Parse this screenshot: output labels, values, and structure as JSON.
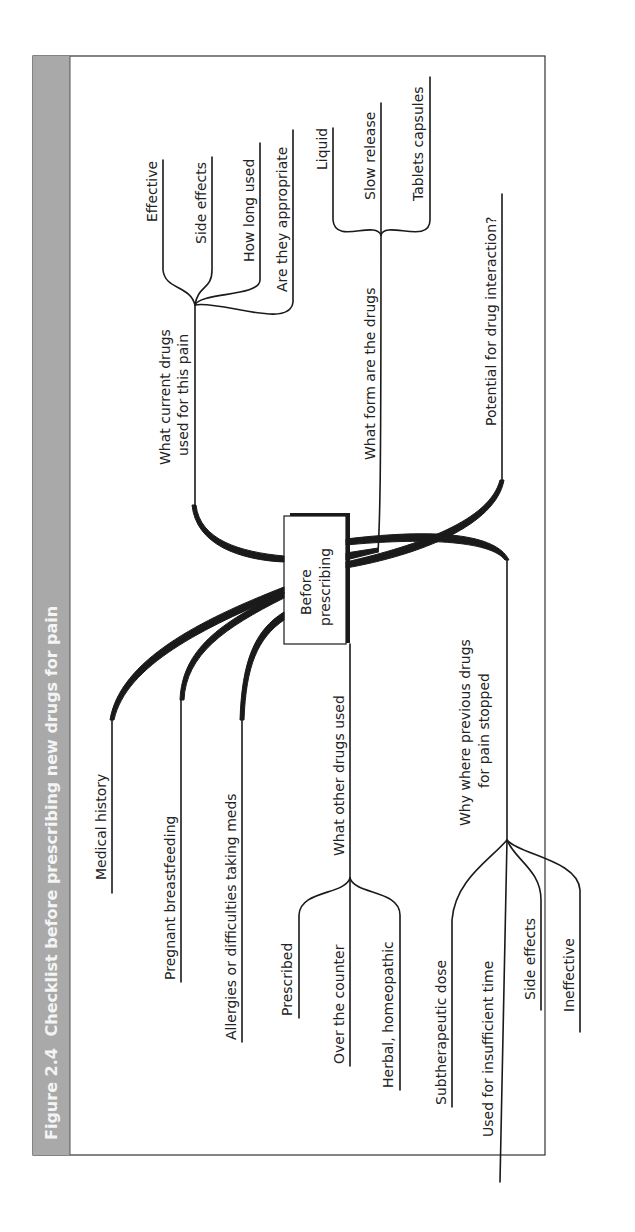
{
  "figure": {
    "number": "Figure 2.4",
    "title": "Checklist before prescribing new drugs for pain",
    "header_band_color": "#a9a9a9",
    "line_color": "#1a1a1a"
  },
  "center": {
    "line1": "Before",
    "line2": "prescribing"
  },
  "branches": {
    "current_drugs": {
      "label_line1": "What current drugs",
      "label_line2": "used for this pain",
      "children": [
        "Effective",
        "Side effects",
        "How long used",
        "Are they appropriate"
      ]
    },
    "drug_form": {
      "label": "What form are the drugs",
      "children": [
        "Liquid",
        "Slow release",
        "Tablets capsules"
      ]
    },
    "interaction": {
      "label": "Potential for drug interaction?"
    },
    "medical_history": {
      "label": "Medical history"
    },
    "pregnant": {
      "label": "Pregnant breastfeeding"
    },
    "allergies": {
      "label": "Allergies or difficulties taking meds"
    },
    "other_drugs": {
      "label": "What other drugs used",
      "children": [
        "Prescribed",
        "Over the counter",
        "Herbal, homeopathic"
      ]
    },
    "previous_drugs": {
      "label_line1": "Why where previous drugs",
      "label_line2": "for pain stopped",
      "children": [
        "Subtherapeutic dose",
        "Used for insufficient time",
        "Side effects",
        "Ineffective"
      ]
    }
  }
}
